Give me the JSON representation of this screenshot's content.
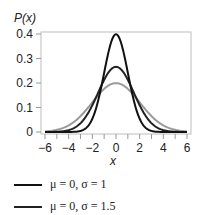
{
  "chart_data": {
    "type": "line",
    "title": "",
    "xlabel": "x",
    "ylabel": "P(x)",
    "xlim": [
      -6,
      6
    ],
    "ylim": [
      0,
      0.4
    ],
    "x_ticks": [
      "−6",
      "−4",
      "−2",
      "0",
      "2",
      "4",
      "6"
    ],
    "y_ticks": [
      "0",
      "0.1",
      "0.2",
      "0.3",
      "0.4"
    ],
    "grid": false,
    "legend_position": "bottom",
    "series": [
      {
        "name": "μ = 0, σ = 1",
        "mu": 0,
        "sigma": 1,
        "peak": 0.399,
        "color": "#111111"
      },
      {
        "name": "μ = 0, σ = 1.5",
        "mu": 0,
        "sigma": 1.5,
        "peak": 0.266,
        "color": "#222222"
      },
      {
        "name": "μ = 0, σ = 2",
        "mu": 0,
        "sigma": 2,
        "peak": 0.199,
        "color": "#9a9a9a"
      }
    ]
  },
  "legend": [
    {
      "label": "μ = 0, σ = 1",
      "color": "#111111"
    },
    {
      "label": "μ = 0, σ = 1.5",
      "color": "#222222"
    }
  ]
}
